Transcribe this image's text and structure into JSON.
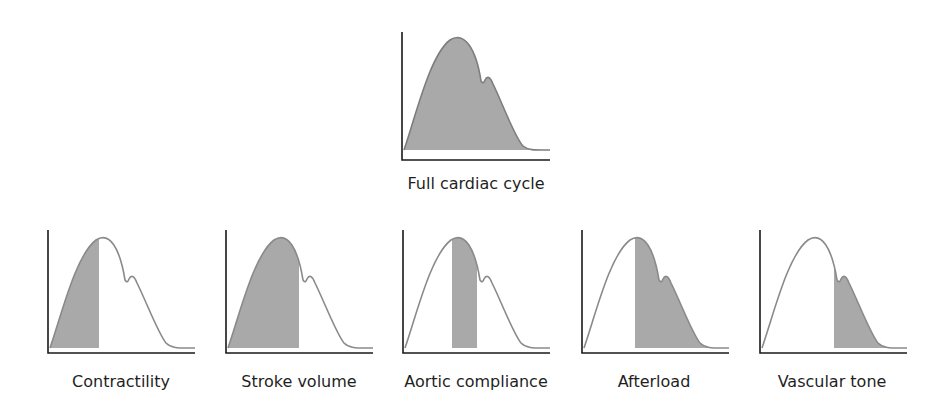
{
  "colors": {
    "curve": "#8a8a8a",
    "fill": "#a9a9a9",
    "axis": "#1a1a1a",
    "text": "#1f1f1f"
  },
  "top_chart": {
    "label": "Full cardiac cycle",
    "shade_from": 0,
    "shade_to": 1
  },
  "bottom_charts": [
    {
      "label": "Contractility",
      "shade_from": 0.0,
      "shade_to": 0.35
    },
    {
      "label": "Stroke volume",
      "shade_from": 0.0,
      "shade_to": 0.53
    },
    {
      "label": "Aortic compliance",
      "shade_from": 0.34,
      "shade_to": 0.52
    },
    {
      "label": "Afterload",
      "shade_from": 0.35,
      "shade_to": 1.0
    },
    {
      "label": "Vascular tone",
      "shade_from": 0.5,
      "shade_to": 1.0
    }
  ]
}
